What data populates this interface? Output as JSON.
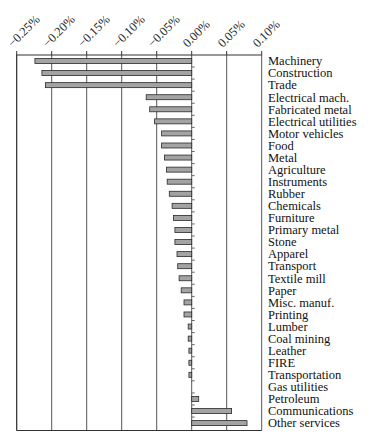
{
  "chart_data": {
    "type": "bar",
    "orientation": "horizontal",
    "title": "",
    "xlabel": "",
    "ylabel": "",
    "xlim": [
      -0.25,
      0.1
    ],
    "x_ticks": [
      "-0.25%",
      "-0.20%",
      "-0.15%",
      "-0.10%",
      "-0.05%",
      "0.00%",
      "0.05%",
      "0.10%"
    ],
    "x_tick_values": [
      -0.25,
      -0.2,
      -0.15,
      -0.1,
      -0.05,
      0.0,
      0.05,
      0.1
    ],
    "x_axis_position": "top",
    "tick_label_rotation": -45,
    "grid": "vertical",
    "legend": null,
    "bar_color": "#a3a3a3",
    "categories": [
      "Machinery",
      "Construction",
      "Trade",
      "Electrical mach.",
      "Fabricated metal",
      "Electrical utilities",
      "Motor vehicles",
      "Food",
      "Metal",
      "Agriculture",
      "Instruments",
      "Rubber",
      "Chemicals",
      "Furniture",
      "Primary metal",
      "Stone",
      "Apparel",
      "Transport",
      "Textile mill",
      "Paper",
      "Misc. manuf.",
      "Printing",
      "Lumber",
      "Coal mining",
      "Leather",
      "FIRE",
      "Transportation",
      "Gas utilities",
      "Petroleum",
      "Communications",
      "Other services"
    ],
    "values": [
      -0.224,
      -0.214,
      -0.209,
      -0.065,
      -0.06,
      -0.053,
      -0.043,
      -0.043,
      -0.039,
      -0.036,
      -0.035,
      -0.032,
      -0.028,
      -0.026,
      -0.024,
      -0.024,
      -0.021,
      -0.02,
      -0.018,
      -0.015,
      -0.011,
      -0.011,
      -0.005,
      -0.005,
      -0.004,
      -0.004,
      -0.004,
      0.0,
      0.01,
      0.057,
      0.079
    ],
    "units": "%"
  }
}
